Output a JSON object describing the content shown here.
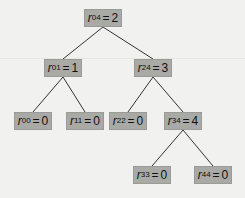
{
  "tree": {
    "colors": {
      "node_fill": "#a9a9a6",
      "edge": "#333333",
      "background": "#f1f1ef"
    },
    "nodes": [
      {
        "id": "r04",
        "var": "r",
        "sub": "04",
        "value": "2",
        "x": 84,
        "y": 9
      },
      {
        "id": "r01",
        "var": "r",
        "sub": "01",
        "value": "1",
        "x": 44,
        "y": 59
      },
      {
        "id": "r24",
        "var": "r",
        "sub": "24",
        "value": "3",
        "x": 134,
        "y": 59
      },
      {
        "id": "r00",
        "var": "r",
        "sub": "00",
        "value": "0",
        "x": 14,
        "y": 112
      },
      {
        "id": "r11",
        "var": "r",
        "sub": "11",
        "value": "0",
        "x": 66,
        "y": 112
      },
      {
        "id": "r22",
        "var": "r",
        "sub": "22",
        "value": "0",
        "x": 109,
        "y": 112
      },
      {
        "id": "r34",
        "var": "r",
        "sub": "34",
        "value": "4",
        "x": 164,
        "y": 112
      },
      {
        "id": "r33",
        "var": "r",
        "sub": "33",
        "value": "0",
        "x": 133,
        "y": 166
      },
      {
        "id": "r44",
        "var": "r",
        "sub": "44",
        "value": "0",
        "x": 194,
        "y": 166
      }
    ],
    "edges": [
      [
        "r04",
        "r01"
      ],
      [
        "r04",
        "r24"
      ],
      [
        "r01",
        "r00"
      ],
      [
        "r01",
        "r11"
      ],
      [
        "r24",
        "r22"
      ],
      [
        "r24",
        "r34"
      ],
      [
        "r34",
        "r33"
      ],
      [
        "r34",
        "r44"
      ]
    ]
  }
}
